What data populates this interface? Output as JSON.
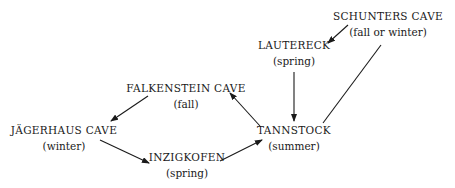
{
  "diagram": {
    "colors": {
      "text": "#1a1a1a",
      "edge": "#1a1a1a",
      "background": "#ffffff"
    },
    "nodes": [
      {
        "id": "schunters",
        "name": "SCHUNTERS CAVE",
        "season": "(fall or winter)",
        "x": 388,
        "y": 9
      },
      {
        "id": "lautereck",
        "name": "LAUTERECK",
        "season": "(spring)",
        "x": 294,
        "y": 38
      },
      {
        "id": "falkenstein",
        "name": "FALKENSTEIN CAVE",
        "season": "(fall)",
        "x": 186,
        "y": 81
      },
      {
        "id": "jagerhaus",
        "name": "JÄGERHAUS CAVE",
        "season": "(winter)",
        "x": 64,
        "y": 123
      },
      {
        "id": "inzigkofen",
        "name": "INZIGKOFEN",
        "season": "(spring)",
        "x": 187,
        "y": 150
      },
      {
        "id": "tannstock",
        "name": "TANNSTOCK",
        "season": "(summer)",
        "x": 294,
        "y": 123
      }
    ],
    "edges": [
      {
        "from": "schunters",
        "to": "lautereck",
        "arrow": true,
        "x1": 348,
        "y1": 25,
        "x2": 328,
        "y2": 43
      },
      {
        "from": "schunters",
        "to": "tannstock",
        "arrow": false,
        "x1": 381,
        "y1": 45,
        "x2": 323,
        "y2": 123
      },
      {
        "from": "lautereck",
        "to": "tannstock",
        "arrow": true,
        "x1": 294,
        "y1": 72,
        "x2": 294,
        "y2": 121
      },
      {
        "from": "tannstock",
        "to": "falkenstein",
        "arrow": true,
        "x1": 260,
        "y1": 126,
        "x2": 230,
        "y2": 93
      },
      {
        "from": "falkenstein",
        "to": "jagerhaus",
        "arrow": true,
        "x1": 148,
        "y1": 96,
        "x2": 111,
        "y2": 121
      },
      {
        "from": "jagerhaus",
        "to": "inzigkofen",
        "arrow": true,
        "x1": 100,
        "y1": 140,
        "x2": 149,
        "y2": 163
      },
      {
        "from": "inzigkofen",
        "to": "tannstock",
        "arrow": true,
        "x1": 220,
        "y1": 161,
        "x2": 262,
        "y2": 140
      }
    ]
  }
}
